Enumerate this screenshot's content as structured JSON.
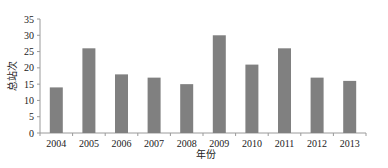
{
  "chart_data": {
    "type": "bar",
    "title": "",
    "xlabel": "年份",
    "ylabel": "总站次",
    "categories": [
      "2004",
      "2005",
      "2006",
      "2007",
      "2008",
      "2009",
      "2010",
      "2011",
      "2012",
      "2013"
    ],
    "values": [
      14,
      26,
      18,
      17,
      15,
      30,
      21,
      26,
      17,
      16
    ],
    "ylim": [
      0,
      35
    ],
    "yticks": [
      0,
      5,
      10,
      15,
      20,
      25,
      30,
      35
    ],
    "grid": false,
    "legend": null,
    "bar_color": "#808080"
  }
}
